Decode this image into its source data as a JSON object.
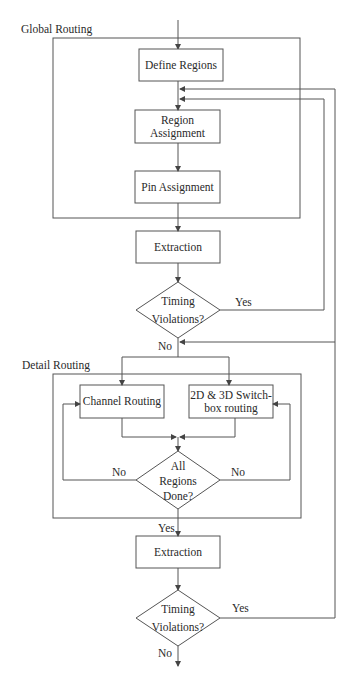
{
  "diagram": {
    "type": "flowchart",
    "groups": {
      "global_routing": "Global Routing",
      "detail_routing": "Detail Routing"
    },
    "nodes": {
      "define_regions": "Define Regions",
      "region_assignment_1": "Region",
      "region_assignment_2": "Assignment",
      "pin_assignment": "Pin Assignment",
      "extraction_1": "Extraction",
      "timing_1_a": "Timing",
      "timing_1_b": "Violations?",
      "channel_routing": "Channel Routing",
      "switchbox_1": "2D & 3D Switch-",
      "switchbox_2": "box routing",
      "all_regions_1": "All",
      "all_regions_2": "Regions",
      "all_regions_3": "Done?",
      "extraction_2": "Extraction",
      "timing_2_a": "Timing",
      "timing_2_b": "Violations?"
    },
    "edge_labels": {
      "timing1_yes": "Yes",
      "timing1_no": "No",
      "all_regions_no_left": "No",
      "all_regions_no_right": "No",
      "all_regions_yes": "Yes",
      "timing2_yes": "Yes",
      "timing2_no": "No"
    },
    "colors": {
      "line": "#555555",
      "text": "#2a2a2a",
      "background": "#ffffff"
    }
  }
}
